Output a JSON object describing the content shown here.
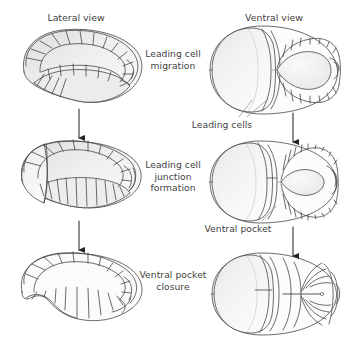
{
  "figure": {
    "title_lateral": "Lateral view",
    "title_ventral": "Ventral view",
    "stage_labels": [
      "Leading cell\nmigration",
      "Leading cell\njunction\nformation",
      "Ventral pocket\nclosure"
    ],
    "annotations": [
      "Leading cells",
      "Ventral pocket"
    ],
    "colors": {
      "outline": "#3c3c3c",
      "text": "#3f3f3f",
      "fill_light": "#f7f7f7",
      "fill_shade": "#e2e2e2",
      "background": "#ffffff",
      "arrow": "#262626",
      "leader": "#8a8a8a"
    },
    "rows": [
      {
        "stage": "Leading cell migration",
        "lateral_view": "open crescent embryo, leading cells along dorsal margin",
        "ventral_view": "wide open ventral pocket ringed by leading cells"
      },
      {
        "stage": "Leading cell junction formation",
        "lateral_view": "crescent narrowing, cells converging ventrally",
        "ventral_view": "narrowed oval ventral pocket"
      },
      {
        "stage": "Ventral pocket closure",
        "lateral_view": "closed kidney-shaped embryo",
        "ventral_view": "fully closed pocket with midline seam"
      }
    ],
    "arrow_count": 4
  }
}
